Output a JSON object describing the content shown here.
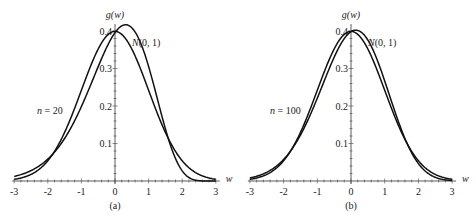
{
  "chart_data": [
    {
      "type": "line",
      "panel_label": "(a)",
      "ylabel": "g(w)",
      "xlabel": "w",
      "x_ticks": [
        "-3",
        "-2",
        "-1",
        "0",
        "1",
        "2",
        "3"
      ],
      "y_ticks": [
        "0.1",
        "0.2",
        "0.3",
        "0.4"
      ],
      "xlim": [
        -3,
        3
      ],
      "ylim": [
        0,
        0.42
      ],
      "series": [
        {
          "name": "N(0, 1)",
          "label": "N(0, 1)",
          "kind": "normal",
          "peak_x": 0,
          "peak_y": 0.399
        },
        {
          "name": "n = 20",
          "label": "n = 20",
          "kind": "standardized-chi-square",
          "df": 20,
          "peak_x": -0.32,
          "peak_y": 0.42
        }
      ]
    },
    {
      "type": "line",
      "panel_label": "(b)",
      "ylabel": "g(w)",
      "xlabel": "w",
      "x_ticks": [
        "-3",
        "-2",
        "-1",
        "0",
        "1",
        "2",
        "3"
      ],
      "y_ticks": [
        "0.1",
        "0.2",
        "0.3",
        "0.4"
      ],
      "xlim": [
        -3,
        3
      ],
      "ylim": [
        0,
        0.42
      ],
      "series": [
        {
          "name": "N(0, 1)",
          "label": "N(0, 1)",
          "kind": "normal",
          "peak_x": 0,
          "peak_y": 0.399
        },
        {
          "name": "n = 100",
          "label": "n = 100",
          "kind": "standardized-chi-square",
          "df": 100,
          "peak_x": -0.14,
          "peak_y": 0.403
        }
      ]
    }
  ]
}
